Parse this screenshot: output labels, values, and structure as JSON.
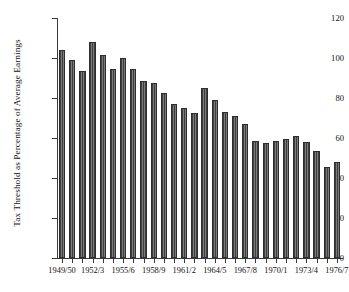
{
  "chart_data": {
    "type": "bar",
    "title": "",
    "xlabel": "",
    "ylabel": "Tax Threshold as Percentage of Average Earnings",
    "ylim": [
      0,
      120
    ],
    "yticks": [
      0,
      20,
      40,
      60,
      80,
      100,
      120
    ],
    "grid": false,
    "legend": null,
    "categories": [
      "1949/50",
      "1950/1",
      "1951/2",
      "1952/3",
      "1953/4",
      "1954/5",
      "1955/6",
      "1956/7",
      "1957/8",
      "1958/9",
      "1959/60",
      "1960/1",
      "1961/2",
      "1962/3",
      "1963/4",
      "1964/5",
      "1965/6",
      "1966/7",
      "1967/8",
      "1968/9",
      "1969/70",
      "1970/1",
      "1971/2",
      "1972/3",
      "1973/4",
      "1974/5",
      "1975/6",
      "1976/7"
    ],
    "values": [
      104,
      99,
      93.5,
      108,
      101.5,
      94.5,
      100,
      94.5,
      88.5,
      87.5,
      82.5,
      77,
      75,
      72.5,
      85,
      79,
      73,
      71,
      67,
      58.5,
      57.5,
      58.5,
      59.5,
      61,
      58,
      53.5,
      45.5,
      48
    ],
    "labelled_ticks": [
      "1949/50",
      "1952/3",
      "1955/6",
      "1958/9",
      "1961/2",
      "1964/5",
      "1967/8",
      "1970/1",
      "1973/4",
      "1976/7"
    ],
    "bar_color": "#595959",
    "axis_color": "#3a3a3a"
  }
}
